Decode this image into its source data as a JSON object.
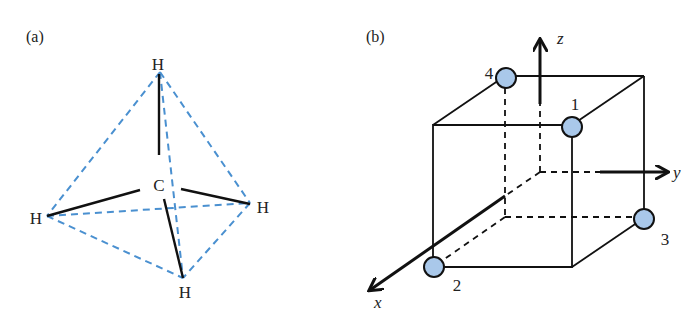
{
  "panels": [
    {
      "label": "(a)",
      "title": "Methane tetrahedron",
      "center_atom": "C",
      "atoms": [
        {
          "symbol": "H",
          "position": "top"
        },
        {
          "symbol": "H",
          "position": "left"
        },
        {
          "symbol": "H",
          "position": "right"
        },
        {
          "symbol": "H",
          "position": "bottom"
        }
      ]
    },
    {
      "label": "(b)",
      "title": "Tetrahedral sites in a cube",
      "axes": {
        "x": "x",
        "y": "y",
        "z": "z"
      },
      "sites": [
        "1",
        "2",
        "3",
        "4"
      ]
    }
  ],
  "colors": {
    "dashed_edge": "#4a90d0",
    "bond": "#111111",
    "atom_fill": "#a9c8ea",
    "atom_stroke": "#111111"
  }
}
